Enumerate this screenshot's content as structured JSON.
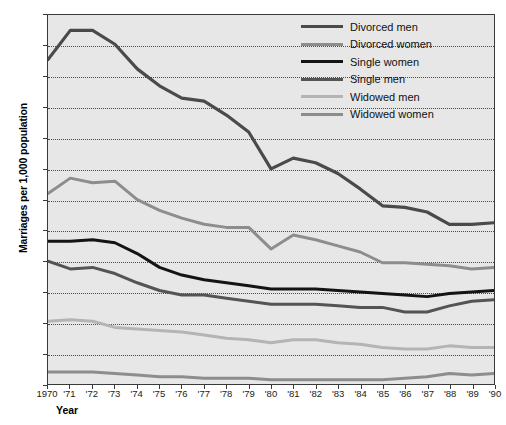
{
  "chart_data": {
    "type": "line",
    "title": "",
    "xlabel": "Year",
    "ylabel": "Marriages per 1,000 population",
    "xlim": [
      1970,
      1990
    ],
    "ylim": [
      0,
      240
    ],
    "ytick_step": 20,
    "grid": true,
    "legend_position": "top-right",
    "background_color": "#e7e7e7",
    "x": [
      1970,
      1971,
      1972,
      1973,
      1974,
      1975,
      1976,
      1977,
      1978,
      1979,
      1980,
      1981,
      1982,
      1983,
      1984,
      1985,
      1986,
      1987,
      1988,
      1989,
      1990
    ],
    "xtick_labels": [
      "1970",
      "'71",
      "'72",
      "'73",
      "'74",
      "'75",
      "'76",
      "'77",
      "'78",
      "'79",
      "'80",
      "'81",
      "'82",
      "'83",
      "'84",
      "'85",
      "'86",
      "'87",
      "'88",
      "'89",
      "'90"
    ],
    "ytick_labels": [
      "0",
      "20",
      "40",
      "60",
      "80",
      "100",
      "120",
      "140",
      "160",
      "180",
      "200",
      "220",
      "240"
    ],
    "series": [
      {
        "name": "Divorced men",
        "color": "#4a4a4a",
        "width": 3.2,
        "values": [
          211,
          230,
          230,
          221,
          205,
          194,
          186,
          184,
          175,
          164,
          140,
          147,
          144,
          137,
          127,
          116,
          115,
          112,
          104,
          104,
          105
        ]
      },
      {
        "name": "Divorced women",
        "color": "#8d8d8d",
        "width": 3.0,
        "values": [
          124,
          134,
          131,
          132,
          120,
          113,
          108,
          104,
          102,
          102,
          88,
          97,
          94,
          90,
          86,
          79,
          79,
          78,
          77,
          75,
          76
        ]
      },
      {
        "name": "Single women",
        "color": "#141414",
        "width": 3.0,
        "values": [
          93,
          93,
          94,
          92,
          85,
          76,
          71,
          68,
          66,
          64,
          62,
          62,
          62,
          61,
          60,
          59,
          58,
          57,
          59,
          60,
          61
        ]
      },
      {
        "name": "Single men",
        "color": "#545454",
        "width": 3.0,
        "values": [
          80,
          75,
          76,
          72,
          66,
          61,
          58,
          58,
          56,
          54,
          52,
          52,
          52,
          51,
          50,
          50,
          47,
          47,
          51,
          54,
          55
        ]
      },
      {
        "name": "Widowed men",
        "color": "#b4b4b4",
        "width": 3.0,
        "values": [
          41,
          42,
          41,
          37,
          36,
          35,
          34,
          32,
          30,
          29,
          27,
          29,
          29,
          27,
          26,
          24,
          23,
          23,
          25,
          24,
          24
        ]
      },
      {
        "name": "Widowed women",
        "color": "#8d8d8d",
        "width": 3.0,
        "values": [
          8,
          8,
          8,
          7,
          6,
          5,
          5,
          4,
          4,
          4,
          3,
          3,
          3,
          3,
          3,
          3,
          4,
          5,
          7,
          6,
          7
        ]
      }
    ]
  }
}
